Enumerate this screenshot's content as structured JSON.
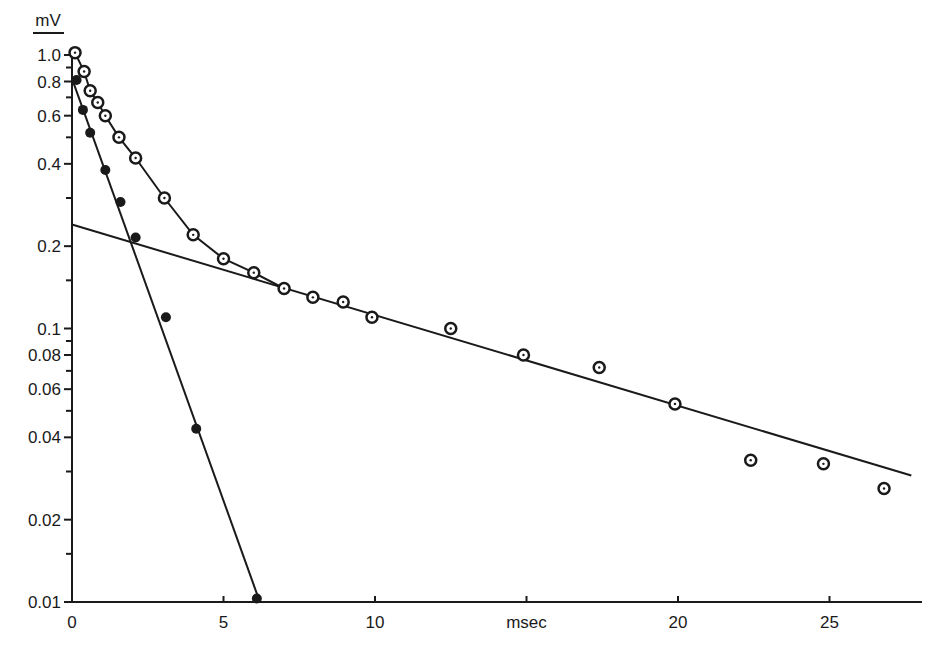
{
  "chart_data": {
    "type": "scatter",
    "title": "",
    "xlabel": "msec",
    "ylabel": "mV",
    "xlim": [
      0,
      28
    ],
    "ylim": [
      0.01,
      1.0
    ],
    "yscale": "log",
    "grid": false,
    "legend": null,
    "x_ticks": [
      0,
      5,
      10,
      20,
      25
    ],
    "x_tick_labels": [
      "0",
      "5",
      "10",
      "20",
      "25"
    ],
    "xlabel_position": 15,
    "y_ticks": [
      1.0,
      0.8,
      0.6,
      0.4,
      0.2,
      0.1,
      0.08,
      0.06,
      0.04,
      0.02,
      0.01
    ],
    "y_tick_labels": [
      "1.0",
      "0.8",
      "0.6",
      "0.4",
      "0.2",
      "0.1",
      "0.08",
      "0.06",
      "0.04",
      "0.02",
      "0.01"
    ],
    "y_minor_ticks": [
      0.9,
      0.7,
      0.5,
      0.3,
      0.15,
      0.09,
      0.07,
      0.05,
      0.03,
      0.015
    ],
    "series": [
      {
        "name": "open circles (total decay)",
        "marker": "open-circle-dot",
        "connected": true,
        "connect_until_index": 11,
        "x": [
          0.1,
          0.4,
          0.6,
          0.85,
          1.1,
          1.55,
          2.1,
          3.05,
          4.0,
          5.0,
          6.0,
          7.0,
          7.95,
          8.95,
          9.9,
          12.5,
          14.9,
          17.4,
          19.9,
          22.4,
          24.8,
          26.8
        ],
        "y": [
          1.02,
          0.87,
          0.74,
          0.67,
          0.6,
          0.5,
          0.42,
          0.3,
          0.22,
          0.18,
          0.16,
          0.14,
          0.13,
          0.125,
          0.11,
          0.1,
          0.08,
          0.072,
          0.053,
          0.033,
          0.032,
          0.026
        ]
      },
      {
        "name": "filled circles (fast component)",
        "marker": "filled-circle",
        "connected": false,
        "x": [
          0.15,
          0.36,
          0.6,
          1.1,
          1.6,
          2.1,
          3.1,
          4.1,
          6.1
        ],
        "y": [
          0.81,
          0.63,
          0.52,
          0.38,
          0.29,
          0.215,
          0.11,
          0.043,
          0.0103
        ]
      }
    ],
    "fit_lines": [
      {
        "name": "slow component fit",
        "x": [
          0,
          27.7
        ],
        "y": [
          0.24,
          0.029
        ]
      },
      {
        "name": "fast component fit",
        "x": [
          0,
          6.2
        ],
        "y": [
          0.82,
          0.01
        ]
      }
    ]
  }
}
